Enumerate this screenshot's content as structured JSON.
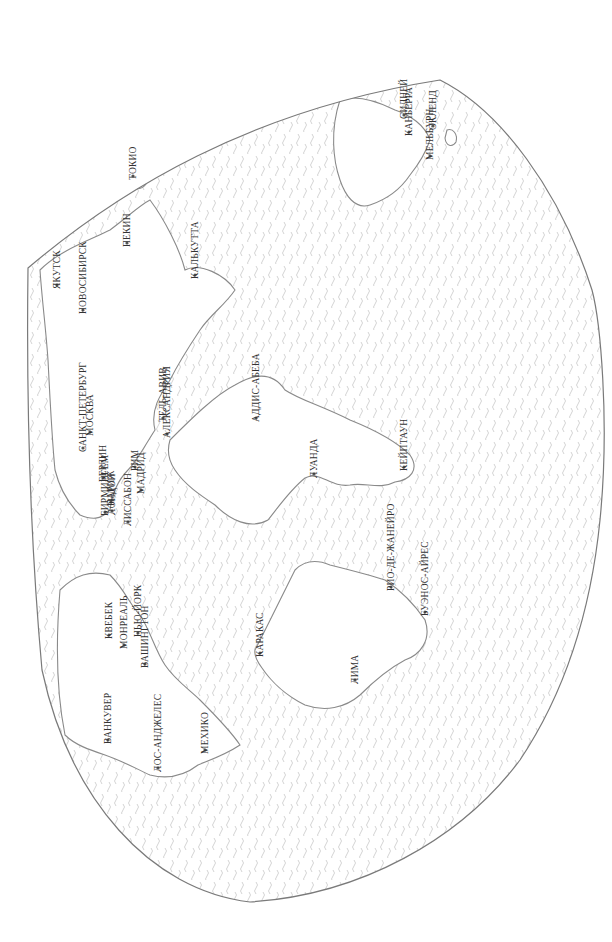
{
  "map": {
    "type": "world-map",
    "orientation": "rotated-90-clockwise",
    "language": "ru",
    "colors": {
      "ocean_pattern": "#c8c8c8",
      "coastline": "#8a8a8a",
      "label": "#333333",
      "background": "#ffffff"
    },
    "cities": [
      {
        "id": "yakutsk",
        "name": "ЯКУТСК",
        "x": 57,
        "y": 285
      },
      {
        "id": "novosibirsk",
        "name": "НОВОСИБИРСК",
        "x": 83,
        "y": 310
      },
      {
        "id": "tokyo",
        "name": "ТОКИО",
        "x": 133,
        "y": 176
      },
      {
        "id": "beijing",
        "name": "ПЕКИН",
        "x": 127,
        "y": 243
      },
      {
        "id": "kolkata",
        "name": "КАЛЬКУТТА",
        "x": 195,
        "y": 275
      },
      {
        "id": "saint-petersburg",
        "name": "САНКТ-ПЕТЕРБУРГ",
        "x": 83,
        "y": 448
      },
      {
        "id": "moscow",
        "name": "МОСКВА",
        "x": 90,
        "y": 432
      },
      {
        "id": "tel-aviv",
        "name": "ТЕЛЬ-АВИВ",
        "x": 163,
        "y": 418
      },
      {
        "id": "alexandria",
        "name": "АЛЕКСАНДРИЯ",
        "x": 167,
        "y": 434
      },
      {
        "id": "berlin",
        "name": "БЕРЛИН",
        "x": 103,
        "y": 478
      },
      {
        "id": "paris",
        "name": "ПАРИЖ",
        "x": 111,
        "y": 502
      },
      {
        "id": "rome",
        "name": "РИМ",
        "x": 135,
        "y": 467
      },
      {
        "id": "madrid",
        "name": "МАДРИД",
        "x": 141,
        "y": 490
      },
      {
        "id": "london",
        "name": "ЛОНДОН",
        "x": 112,
        "y": 511
      },
      {
        "id": "birmingham",
        "name": "БИРМИНГЕМ",
        "x": 105,
        "y": 512
      },
      {
        "id": "lisbon",
        "name": "ЛИССАБОН",
        "x": 128,
        "y": 522
      },
      {
        "id": "addis-ababa",
        "name": "АДДИС-АБЕБА",
        "x": 256,
        "y": 418
      },
      {
        "id": "luanda",
        "name": "ЛУАНДА",
        "x": 314,
        "y": 474
      },
      {
        "id": "cape-town",
        "name": "КЕЙПТАУН",
        "x": 404,
        "y": 467
      },
      {
        "id": "new-york",
        "name": "НЬЮ-ЙОРК",
        "x": 138,
        "y": 633
      },
      {
        "id": "quebec",
        "name": "КВЕБЕК",
        "x": 109,
        "y": 635
      },
      {
        "id": "montreal",
        "name": "МОНРЕАЛЬ",
        "x": 124,
        "y": 645
      },
      {
        "id": "washington",
        "name": "ВАШИНГТОН",
        "x": 145,
        "y": 664
      },
      {
        "id": "vancouver",
        "name": "ВАНКУВЕР",
        "x": 108,
        "y": 740
      },
      {
        "id": "los-angeles",
        "name": "ЛОС-АНДЖЕЛЕС",
        "x": 158,
        "y": 768
      },
      {
        "id": "mexico-city",
        "name": "МЕХИКО",
        "x": 205,
        "y": 750
      },
      {
        "id": "caracas",
        "name": "КАРАКАС",
        "x": 260,
        "y": 653
      },
      {
        "id": "lima",
        "name": "ЛИМА",
        "x": 355,
        "y": 680
      },
      {
        "id": "rio-de-janeiro",
        "name": "РИО-ДЕ-ЖАНЕЙРО",
        "x": 391,
        "y": 587
      },
      {
        "id": "buenos-aires",
        "name": "БУЭНОС-АЙРЕС",
        "x": 425,
        "y": 612
      },
      {
        "id": "sydney",
        "name": "СИДНЕЙ",
        "x": 404,
        "y": 115
      },
      {
        "id": "canberra",
        "name": "КАНБЕРРА",
        "x": 409,
        "y": 132
      },
      {
        "id": "melbourne",
        "name": "МЕЛЬБУРН",
        "x": 430,
        "y": 156
      },
      {
        "id": "auckland",
        "name": "ОКЛЕНД",
        "x": 433,
        "y": 126
      }
    ]
  }
}
